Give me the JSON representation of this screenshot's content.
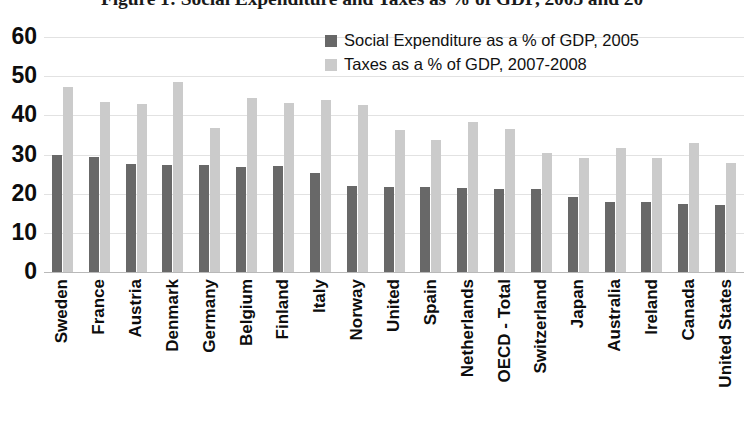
{
  "figure": {
    "title": "Figure 1: Social Expenditure and Taxes as % of GDP, 2005 and 20"
  },
  "legend": {
    "position": "inside-top-center",
    "items": [
      {
        "label": "Social Expenditure as a % of GDP, 2005",
        "color": "#686868",
        "swatch_icon": "square-swatch-dark"
      },
      {
        "label": "Taxes as a % of GDP, 2007-2008",
        "color": "#cbcbcb",
        "swatch_icon": "square-swatch-light"
      }
    ]
  },
  "axes": {
    "y_ticks": [
      "60",
      "50",
      "40",
      "30",
      "20",
      "10",
      "0"
    ],
    "y_tick_values": [
      60,
      50,
      40,
      30,
      20,
      10,
      0
    ]
  },
  "chart_data": {
    "type": "bar",
    "title": "Figure 1: Social Expenditure and Taxes as % of GDP, 2005 and 20",
    "xlabel": "",
    "ylabel": "",
    "ylim": [
      0,
      60
    ],
    "ytick_step": 10,
    "grid": true,
    "legend_position": "inside-top-center",
    "categories": [
      "Sweden",
      "France",
      "Austria",
      "Denmark",
      "Germany",
      "Belgium",
      "Finland",
      "Italy",
      "Norway",
      "United",
      "Spain",
      "Netherlands",
      "OECD - Total",
      "Switzerland",
      "Japan",
      "Australia",
      "Ireland",
      "Canada",
      "United States"
    ],
    "series": [
      {
        "name": "Social Expenditure as a % of GDP, 2005",
        "color": "#686868",
        "values": [
          29.8,
          29.3,
          27.5,
          27.4,
          27.2,
          26.8,
          27.0,
          25.4,
          22.0,
          21.6,
          21.7,
          21.4,
          21.1,
          21.1,
          19.2,
          18.0,
          17.8,
          17.3,
          17.0
        ]
      },
      {
        "name": "Taxes as a % of GDP, 2007-2008",
        "color": "#cbcbcb",
        "values": [
          47.2,
          43.5,
          43.0,
          48.5,
          36.8,
          44.5,
          43.1,
          43.9,
          42.6,
          36.2,
          33.7,
          38.2,
          36.4,
          30.3,
          29.0,
          31.7,
          29.0,
          33.0,
          27.8
        ]
      }
    ]
  }
}
